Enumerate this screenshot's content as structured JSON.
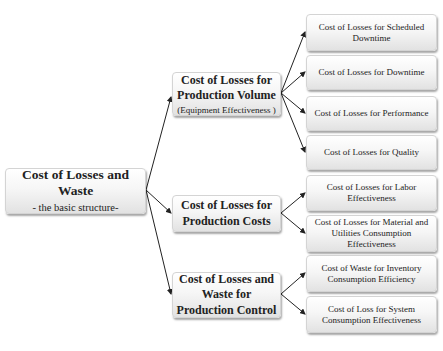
{
  "root": {
    "title": "Cost of Losses and Waste",
    "subtitle": "- the basic structure-"
  },
  "branches": [
    {
      "title": "Cost of Losses for Production Volume",
      "subtitle": "(Equipment Effectiveness )",
      "children": [
        "Cost of Losses for Scheduled Downtime",
        "Cost of Losses for Downtime",
        "Cost of Losses for Performance",
        "Cost of Losses for Quality"
      ]
    },
    {
      "title": "Cost of Losses for Production Costs",
      "subtitle": "",
      "children": [
        "Cost of Losses for Labor Effectiveness",
        "Cost of Losses for Material and Utilities Consumption Effectiveness"
      ]
    },
    {
      "title": "Cost of Losses and Waste for Production Control",
      "subtitle": "",
      "children": [
        "Cost of Waste for Inventory Consumption Efficiency",
        "Cost of Loss for System Consumption Effectiveness"
      ]
    }
  ]
}
